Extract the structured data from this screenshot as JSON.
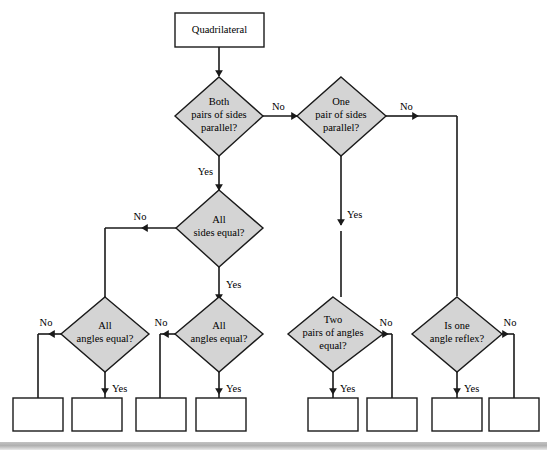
{
  "diagram": {
    "type": "flowchart",
    "colors": {
      "decision_fill": "#d4d4d4",
      "terminal_fill": "#ffffff",
      "result_fill": "#ffffff",
      "stroke": "#1a1a1a",
      "background": "#ffffff",
      "footer_bar": "#b0b0b0"
    },
    "start": {
      "label": "Quadrilateral",
      "shape": "rectangle"
    },
    "decisions": [
      {
        "id": "both-pairs-parallel",
        "label": "Both pairs of sides parallel?",
        "lines": [
          "Both",
          "pairs of sides",
          "parallel?"
        ],
        "shape": "diamond",
        "yes_label": "Yes",
        "no_label": "No"
      },
      {
        "id": "one-pair-parallel",
        "label": "One pair of sides parallel?",
        "lines": [
          "One",
          "pair of sides",
          "parallel?"
        ],
        "shape": "diamond",
        "yes_label": "Yes",
        "no_label": "No"
      },
      {
        "id": "all-sides-equal",
        "label": "All sides equal?",
        "lines": [
          "All",
          "sides equal?"
        ],
        "shape": "diamond",
        "yes_label": "Yes",
        "no_label": "No"
      },
      {
        "id": "all-angles-equal-left",
        "label": "All angles equal?",
        "lines": [
          "All",
          "angles equal?"
        ],
        "shape": "diamond",
        "yes_label": "Yes",
        "no_label": "No"
      },
      {
        "id": "all-angles-equal-mid",
        "label": "All angles equal?",
        "lines": [
          "All",
          "angles equal?"
        ],
        "shape": "diamond",
        "yes_label": "Yes",
        "no_label": "No"
      },
      {
        "id": "two-pairs-angles-equal",
        "label": "Two pairs of angles equal?",
        "lines": [
          "Two",
          "pairs of angles",
          "equal?"
        ],
        "shape": "diamond",
        "yes_label": "Yes",
        "no_label": "No"
      },
      {
        "id": "one-angle-reflex",
        "label": "Is one angle reflex?",
        "lines": [
          "Is one",
          "angle reflex?"
        ],
        "shape": "diamond",
        "yes_label": "Yes",
        "no_label": "No"
      }
    ],
    "results": [
      {
        "id": "result-1",
        "label": ""
      },
      {
        "id": "result-2",
        "label": ""
      },
      {
        "id": "result-3",
        "label": ""
      },
      {
        "id": "result-4",
        "label": ""
      },
      {
        "id": "result-5",
        "label": ""
      },
      {
        "id": "result-6",
        "label": ""
      },
      {
        "id": "result-7",
        "label": ""
      },
      {
        "id": "result-8",
        "label": ""
      }
    ],
    "edge_labels": {
      "yes": "Yes",
      "no": "No"
    }
  }
}
